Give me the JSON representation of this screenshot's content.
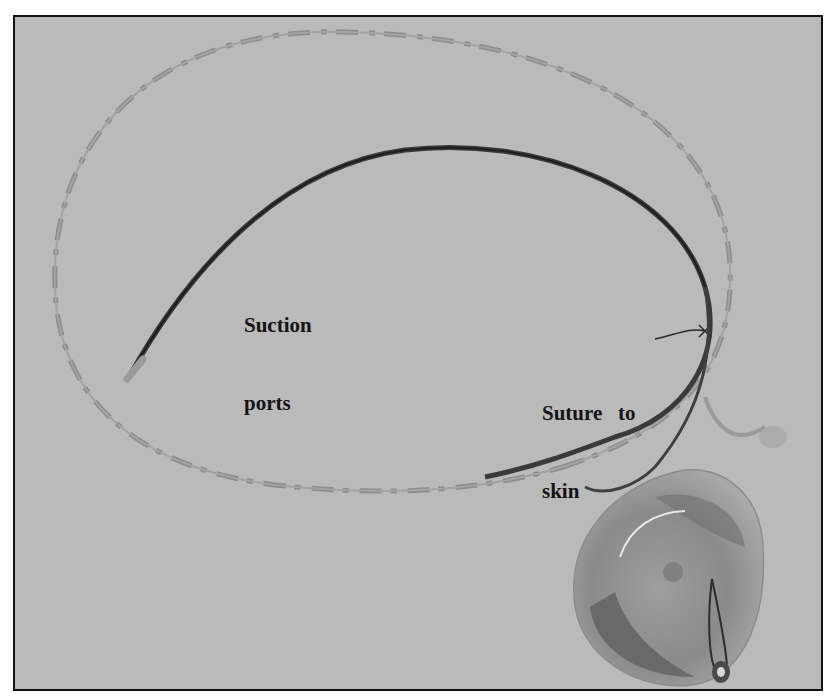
{
  "figure": {
    "type": "photograph",
    "background_color": "#b9b9b9",
    "border_color": "#111111"
  },
  "labels": {
    "suction_ports": {
      "line1": "Suction",
      "line2": "ports"
    },
    "suture_to_skin": {
      "line1": "Suture   to",
      "line2": "skin"
    }
  }
}
